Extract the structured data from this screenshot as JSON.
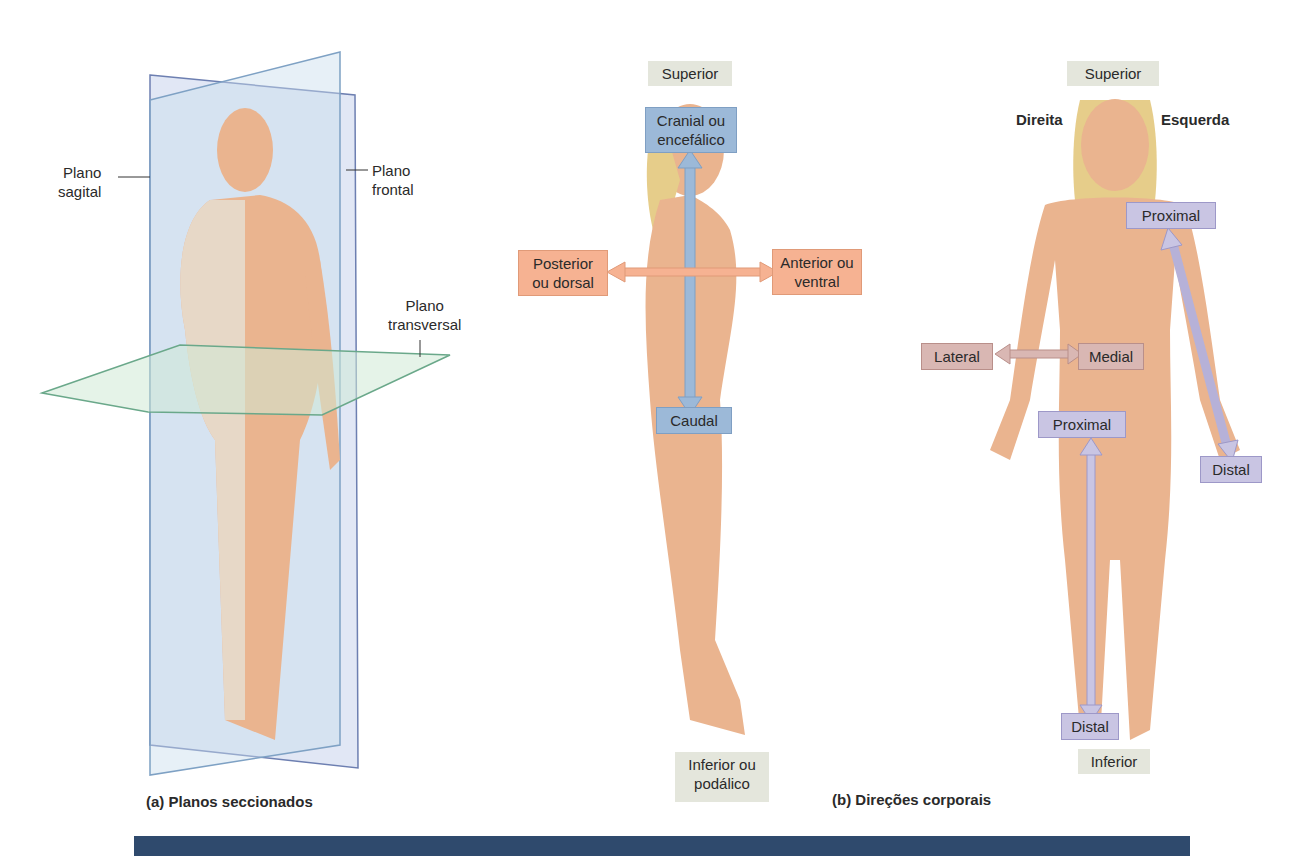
{
  "figure_a": {
    "labels": {
      "sagital": "Plano\nsagital",
      "frontal": "Plano\nfrontal",
      "transversal": "Plano\ntransversal"
    },
    "caption": "(a) Planos seccionados"
  },
  "figure_b": {
    "side_view": {
      "superior": "Superior",
      "cranial": "Cranial ou encefálico",
      "posterior": "Posterior ou dorsal",
      "anterior": "Anterior ou ventral",
      "caudal": "Caudal",
      "inferior": "Inferior ou podálico"
    },
    "front_view": {
      "superior": "Superior",
      "direita": "Direita",
      "esquerda": "Esquerda",
      "proximal_arm": "Proximal",
      "distal_arm": "Distal",
      "lateral": "Lateral",
      "medial": "Medial",
      "proximal_leg": "Proximal",
      "distal_leg": "Distal",
      "inferior": "Inferior"
    },
    "caption": "(b) Direções corporais"
  },
  "colors": {
    "axis_blue": "#9cb9d8",
    "axis_orange": "#f6b292",
    "axis_violet": "#c9c5e3",
    "axis_rose": "#d9b7b3",
    "label_gray": "#e4e6dc",
    "bar_navy": "#2f4a6d",
    "skin": "#eab48f"
  }
}
